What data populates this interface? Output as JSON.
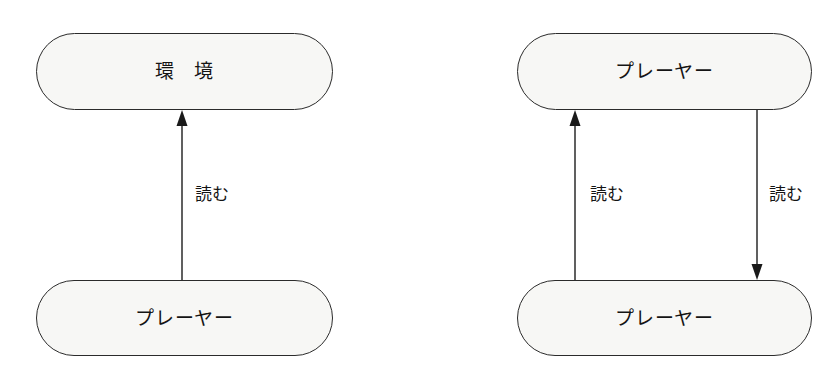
{
  "page": {
    "background_color": "#ffffff",
    "width": 834,
    "height": 377
  },
  "style": {
    "node_fill": "#f7f7f5",
    "node_stroke": "#2b2b2b",
    "arrow_color": "#1a1a1a",
    "text_color": "#141414"
  },
  "diagrams": [
    {
      "id": "diagram-left",
      "nodes": [
        {
          "id": "left-top",
          "label": "環　境",
          "role": "environment"
        },
        {
          "id": "left-bottom",
          "label": "プレーヤー",
          "role": "player"
        }
      ],
      "edges": [
        {
          "id": "left-edge-up",
          "label": "読む",
          "from": "left-bottom",
          "to": "left-top",
          "direction": "up"
        }
      ]
    },
    {
      "id": "diagram-right",
      "nodes": [
        {
          "id": "right-top",
          "label": "プレーヤー",
          "role": "player"
        },
        {
          "id": "right-bottom",
          "label": "プレーヤー",
          "role": "player"
        }
      ],
      "edges": [
        {
          "id": "right-edge-up",
          "label": "読む",
          "from": "right-bottom",
          "to": "right-top",
          "direction": "up"
        },
        {
          "id": "right-edge-down",
          "label": "読む",
          "from": "right-top",
          "to": "right-bottom",
          "direction": "down"
        }
      ]
    }
  ]
}
